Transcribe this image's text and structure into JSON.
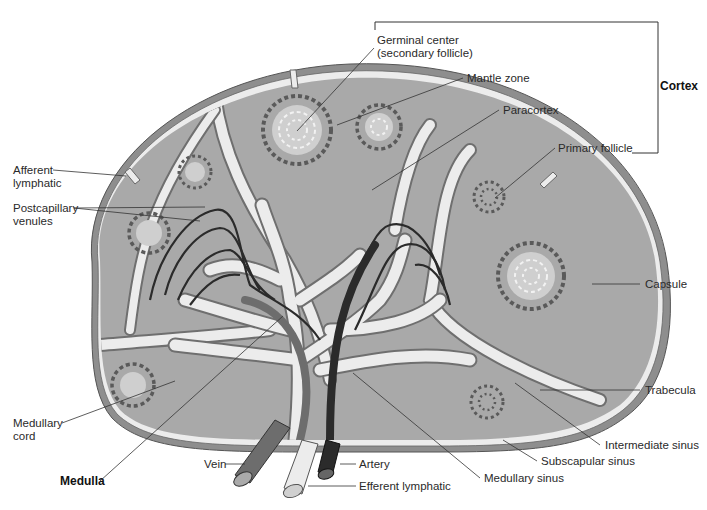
{
  "diagram": {
    "colors": {
      "background": "#ffffff",
      "capsule": "#8e8e8e",
      "tissue": "#a9a9a9",
      "sinus": "#ececec",
      "follicle_dash": "#5a5a5a",
      "germinal_center": "#cfcfcf",
      "vessel_dark": "#2b2b2b",
      "vein": "#6d6d6d",
      "leader_line": "#333333"
    },
    "regions": {
      "cortex": "Cortex",
      "medulla": "Medulla"
    },
    "labels": {
      "germinal_center": "Germinal center\n(secondary follicle)",
      "mantle_zone": "Mantle zone",
      "cortex": "Cortex",
      "paracortex": "Paracortex",
      "primary_follicle": "Primary follicle",
      "afferent_lymphatic": "Afferent\nlymphatic",
      "postcapillary_venules": "Postcapillary\nvenules",
      "capsule": "Capsule",
      "trabecula": "Trabecula",
      "medullary_cord": "Medullary\ncord",
      "intermediate_sinus": "Intermediate sinus",
      "subscapular_sinus": "Subscapular sinus",
      "vein": "Vein",
      "artery": "Artery",
      "medulla": "Medulla",
      "medullary_sinus": "Medullary sinus",
      "efferent_lymphatic": "Efferent lymphatic"
    }
  }
}
